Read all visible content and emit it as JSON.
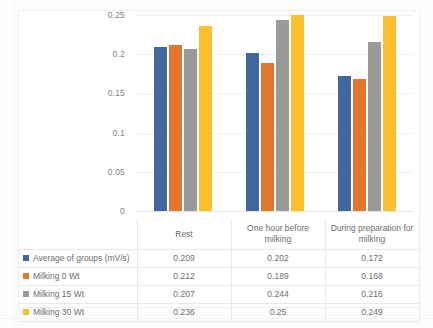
{
  "chart_data": {
    "type": "bar",
    "title": "",
    "xlabel": "",
    "ylabel": "",
    "categories": [
      "Rest",
      "One hour before milking",
      "During preparation for milking"
    ],
    "series": [
      {
        "name": "Average of groups (mV/s)",
        "color": "#41689e",
        "values": [
          0.209,
          0.202,
          0.172
        ],
        "value_labels": [
          "0.209",
          "0.202",
          "0.172"
        ]
      },
      {
        "name": "Milking 0 Wt",
        "color": "#e2762c",
        "values": [
          0.212,
          0.189,
          0.168
        ],
        "value_labels": [
          "0.212",
          "0.189",
          "0.168"
        ]
      },
      {
        "name": "Milking 15 Wt",
        "color": "#9a9a9a",
        "values": [
          0.207,
          0.244,
          0.216
        ],
        "value_labels": [
          "0.207",
          "0.244",
          "0.216"
        ]
      },
      {
        "name": "Milking 30 Wt",
        "color": "#fbc02d",
        "values": [
          0.236,
          0.25,
          0.249
        ],
        "value_labels": [
          "0.236",
          "0.25",
          "0.249"
        ]
      }
    ],
    "ylim": [
      0,
      0.25
    ],
    "yticks": [
      "0",
      "0.05",
      "0.1",
      "0.15",
      "0.2",
      "0.25"
    ],
    "ytick_values": [
      0,
      0.05,
      0.1,
      0.15,
      0.2,
      0.25
    ],
    "grid": true,
    "legend_position": "data-table-left",
    "has_data_table": true
  },
  "table": {
    "corner_label": "",
    "column_headers": [
      "Rest",
      "One hour before milking",
      "During preparation for milking"
    ],
    "rows": [
      {
        "label": "Average of groups (mV/s)",
        "color": "#41689e",
        "cells": [
          "0.209",
          "0.202",
          "0.172"
        ]
      },
      {
        "label": "Milking 0 Wt",
        "color": "#e2762c",
        "cells": [
          "0.212",
          "0.189",
          "0.168"
        ]
      },
      {
        "label": "Milking 15 Wt",
        "color": "#9a9a9a",
        "cells": [
          "0.207",
          "0.244",
          "0.216"
        ]
      },
      {
        "label": "Milking 30 Wt",
        "color": "#fbc02d",
        "cells": [
          "0.236",
          "0.25",
          "0.249"
        ]
      }
    ]
  }
}
